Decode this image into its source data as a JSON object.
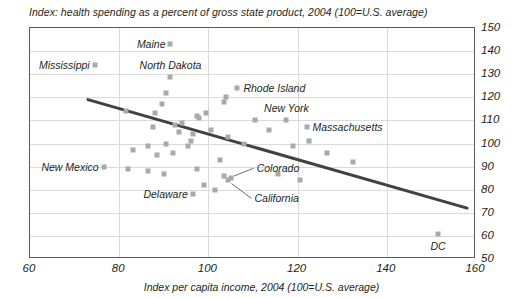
{
  "chart_data": {
    "type": "scatter",
    "title": "Index: health spending as a percent of gross state product, 2004 (100=U.S. average)",
    "xlabel": "Index per capita income, 2004 (100=U.S. average)",
    "ylabel": "",
    "xlim": [
      60,
      160
    ],
    "ylim": [
      50,
      150
    ],
    "xticks": [
      60,
      80,
      100,
      120,
      140,
      160
    ],
    "yticks": [
      50,
      60,
      70,
      80,
      90,
      100,
      110,
      120,
      130,
      140,
      150
    ],
    "grid": true,
    "legend": "none",
    "y_axis_position": "right",
    "marker_color": "#a7a9ac",
    "trend_color": "#414042",
    "axis_color": "#58595b",
    "grid_color": "#d9dadb",
    "points": [
      {
        "x": 91.5,
        "y": 143,
        "label": "Maine",
        "label_pos": "left"
      },
      {
        "x": 74.5,
        "y": 134,
        "label": "Mississippi",
        "label_pos": "left"
      },
      {
        "x": 91.5,
        "y": 129,
        "label": "North Dakota",
        "label_pos": "above"
      },
      {
        "x": 90.5,
        "y": 122
      },
      {
        "x": 89.5,
        "y": 117
      },
      {
        "x": 81.5,
        "y": 114
      },
      {
        "x": 88.0,
        "y": 113
      },
      {
        "x": 106.5,
        "y": 124,
        "label": "Rhode Island",
        "label_pos": "right"
      },
      {
        "x": 104.0,
        "y": 120
      },
      {
        "x": 103.5,
        "y": 118
      },
      {
        "x": 99.5,
        "y": 113
      },
      {
        "x": 97.5,
        "y": 112
      },
      {
        "x": 98.0,
        "y": 111
      },
      {
        "x": 94.0,
        "y": 109
      },
      {
        "x": 92.5,
        "y": 108
      },
      {
        "x": 87.5,
        "y": 107
      },
      {
        "x": 93.5,
        "y": 105
      },
      {
        "x": 96.5,
        "y": 104
      },
      {
        "x": 96.0,
        "y": 101
      },
      {
        "x": 95.5,
        "y": 99
      },
      {
        "x": 90.5,
        "y": 100
      },
      {
        "x": 86.5,
        "y": 99
      },
      {
        "x": 83.0,
        "y": 97
      },
      {
        "x": 88.5,
        "y": 95
      },
      {
        "x": 92.0,
        "y": 96
      },
      {
        "x": 100.5,
        "y": 106
      },
      {
        "x": 104.5,
        "y": 103
      },
      {
        "x": 108.0,
        "y": 100
      },
      {
        "x": 110.5,
        "y": 110
      },
      {
        "x": 113.5,
        "y": 106
      },
      {
        "x": 117.5,
        "y": 110,
        "label": "New York",
        "label_pos": "above"
      },
      {
        "x": 122.0,
        "y": 107,
        "label": "Massachusetts",
        "label_pos": "right"
      },
      {
        "x": 122.5,
        "y": 101
      },
      {
        "x": 119.0,
        "y": 99
      },
      {
        "x": 126.5,
        "y": 96
      },
      {
        "x": 132.5,
        "y": 92
      },
      {
        "x": 76.5,
        "y": 90,
        "label": "New Mexico",
        "label_pos": "left"
      },
      {
        "x": 82.0,
        "y": 89
      },
      {
        "x": 86.5,
        "y": 88
      },
      {
        "x": 90.0,
        "y": 87
      },
      {
        "x": 97.5,
        "y": 89
      },
      {
        "x": 102.5,
        "y": 93
      },
      {
        "x": 103.5,
        "y": 86
      },
      {
        "x": 105.0,
        "y": 85,
        "label": "Colorado",
        "label_pos": "leader-up"
      },
      {
        "x": 104.5,
        "y": 84,
        "label": "California",
        "label_pos": "leader-down"
      },
      {
        "x": 99.0,
        "y": 82
      },
      {
        "x": 101.5,
        "y": 80
      },
      {
        "x": 96.5,
        "y": 78,
        "label": "Delaware",
        "label_pos": "left"
      },
      {
        "x": 115.5,
        "y": 87
      },
      {
        "x": 120.5,
        "y": 84
      },
      {
        "x": 151.5,
        "y": 61,
        "label": "DC",
        "label_pos": "below"
      }
    ],
    "trend_line": {
      "x1": 73,
      "y1": 119,
      "x2": 158,
      "y2": 72
    }
  }
}
